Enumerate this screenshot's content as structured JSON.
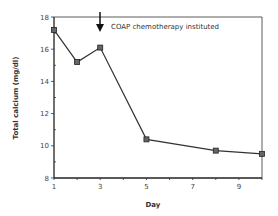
{
  "chart_data": {
    "type": "line",
    "title": "",
    "xlabel": "Day",
    "ylabel": "Total calcium (mg/dl)",
    "x": [
      1,
      2,
      3,
      5,
      8,
      10
    ],
    "series": [
      {
        "name": "Total calcium",
        "values": [
          17.2,
          15.2,
          16.1,
          10.4,
          9.7,
          9.5
        ]
      }
    ],
    "xlim": [
      1,
      10
    ],
    "ylim": [
      8,
      18
    ],
    "xticks": [
      1,
      3,
      5,
      7,
      9
    ],
    "yticks": [
      8,
      10,
      12,
      14,
      16,
      18
    ],
    "grid": false,
    "legend": null,
    "annotations": [
      {
        "text": "COAP chemotherapy instituted",
        "x": 3,
        "type": "arrow-down"
      }
    ],
    "marker": "square",
    "line_color": "#333333"
  },
  "labels": {
    "xlabel": "Day",
    "ylabel": "Total calcium (mg/dl)",
    "annotation": "COAP chemotherapy instituted",
    "xticks": [
      "1",
      "3",
      "5",
      "7",
      "9"
    ],
    "yticks": [
      "8",
      "10",
      "12",
      "14",
      "16",
      "18"
    ]
  }
}
